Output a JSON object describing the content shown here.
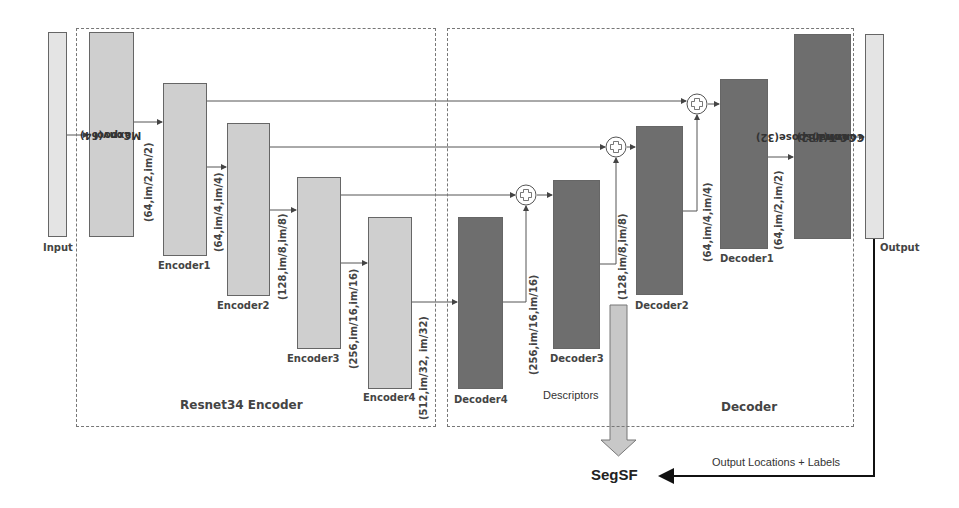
{
  "diagram": {
    "sections": {
      "encoder": "Resnet34 Encoder",
      "decoder": "Decoder"
    },
    "input_label": "Input",
    "output_label": "Output",
    "stem_block": [
      "Conv(64)",
      "Maxpool"
    ],
    "head_block": [
      "ConvTranspose(32)",
      "Conv(32)",
      "Conv(1)"
    ],
    "encoders": [
      {
        "name": "Encoder1",
        "shape": "(64,im/2,im/2)"
      },
      {
        "name": "Encoder2",
        "shape": "(64,im/4,im/4)"
      },
      {
        "name": "Encoder3",
        "shape": "(128,im/8,im/8)"
      },
      {
        "name": "Encoder4",
        "shape": "(256,im/16,im/16)"
      }
    ],
    "encoder4_out_shape": "(512,im/32, im/32)",
    "decoders": [
      {
        "name": "Decoder4",
        "shape": "(256,im/16,im/16)"
      },
      {
        "name": "Decoder3",
        "shape": "(128,im/8,im/8)"
      },
      {
        "name": "Decoder2",
        "shape": "(64,im/4,im/4)"
      },
      {
        "name": "Decoder1",
        "shape": "(64,im/2,im/2)"
      }
    ],
    "descriptors_label": "Descriptors",
    "segsf_label": "SegSF",
    "output_arrow_label": "Output Locations + Labels",
    "colors": {
      "encoder_block": "#cfcfcf",
      "decoder_block": "#6e6e6e",
      "io_block": "#e4e4e4"
    }
  }
}
